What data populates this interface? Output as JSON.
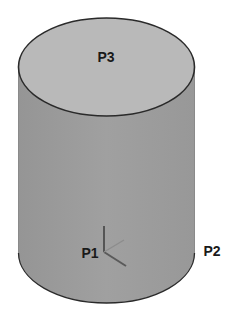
{
  "diagram": {
    "type": "cylinder-3d",
    "labels": {
      "top_face": "P3",
      "origin": "P1",
      "side_edge": "P2"
    },
    "colors": {
      "background": "#ffffff",
      "top_face": "#b9b9b9",
      "side_face": "#9a9a9a",
      "outline": "#2a2a2a",
      "axis": "#555555"
    }
  }
}
